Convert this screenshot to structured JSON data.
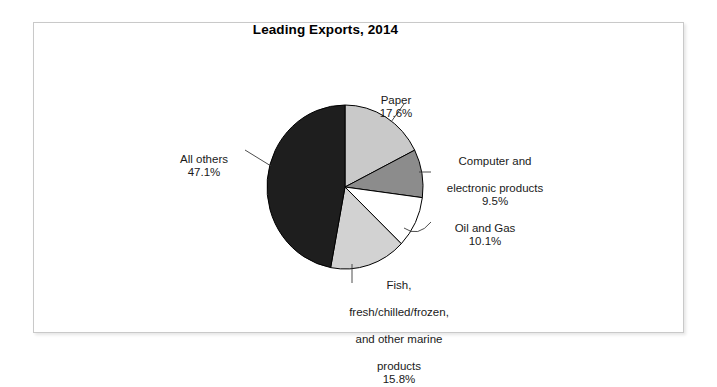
{
  "figure": {
    "title": "Leading Exports, 2014",
    "frame_color": "#c9c9c9",
    "background": "#ffffff"
  },
  "chart_data": {
    "type": "pie",
    "title": "Leading Exports, 2014",
    "xlabel": "",
    "ylabel": "",
    "unit": "percent",
    "start_angle_deg": 0,
    "direction": "clockwise",
    "legend_position": "none",
    "labels_outside": true,
    "categories": [
      "Paper",
      "Computer and electronic products",
      "Oil and Gas",
      "Fish, fresh/chilled/frozen, and other marine products",
      "All others"
    ],
    "values": [
      17.6,
      9.5,
      10.1,
      15.8,
      47.1
    ],
    "value_labels": [
      "17.6%",
      "9.5%",
      "10.1%",
      "15.8%",
      "47.1%"
    ],
    "colors": [
      "#c9c9c9",
      "#8c8c8c",
      "#ffffff",
      "#d2d2d2",
      "#1e1e1e"
    ],
    "slices": [
      {
        "name": "Paper",
        "label_lines": [
          "Paper"
        ],
        "value": 17.6,
        "value_label": "17.6%",
        "color": "#c9c9c9"
      },
      {
        "name": "Computer and electronic products",
        "label_lines": [
          "Computer and",
          "electronic products"
        ],
        "value": 9.5,
        "value_label": "9.5%",
        "color": "#8c8c8c"
      },
      {
        "name": "Oil and Gas",
        "label_lines": [
          "Oil and Gas"
        ],
        "value": 10.1,
        "value_label": "10.1%",
        "color": "#ffffff"
      },
      {
        "name": "Fish, fresh/chilled/frozen, and other marine products",
        "label_lines": [
          "Fish,",
          "fresh/chilled/frozen,",
          "and other marine",
          "products"
        ],
        "value": 15.8,
        "value_label": "15.8%",
        "color": "#d2d2d2"
      },
      {
        "name": "All others",
        "label_lines": [
          "All others"
        ],
        "value": 47.1,
        "value_label": "47.1%",
        "color": "#1e1e1e"
      }
    ]
  },
  "labels": {
    "paper": {
      "line1": "Paper",
      "pct": "17.6%"
    },
    "computer": {
      "line1": "Computer and",
      "line2": "electronic products",
      "pct": "9.5%"
    },
    "oil": {
      "line1": "Oil and Gas",
      "pct": "10.1%"
    },
    "fish": {
      "line1": "Fish,",
      "line2": "fresh/chilled/frozen,",
      "line3": "and other marine",
      "line4": "products",
      "pct": "15.8%"
    },
    "allothers": {
      "line1": "All others",
      "pct": "47.1%"
    }
  }
}
